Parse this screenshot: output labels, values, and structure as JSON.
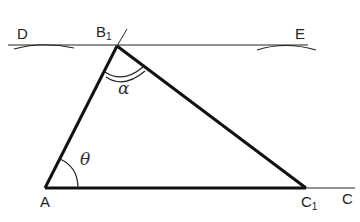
{
  "diagram": {
    "type": "geometric construction - triangle",
    "points": {
      "D": {
        "label": "D",
        "x": 18,
        "y": 26
      },
      "B1": {
        "label": "B",
        "sub": "1",
        "x": 96,
        "y": 24
      },
      "E": {
        "label": "E",
        "x": 295,
        "y": 26
      },
      "A": {
        "label": "A",
        "x": 40,
        "y": 194
      },
      "C1": {
        "label": "C",
        "sub": "1",
        "x": 302,
        "y": 194
      },
      "C": {
        "label": "C",
        "x": 342,
        "y": 192
      }
    },
    "angles": {
      "alpha": {
        "label": "α",
        "at": "B1"
      },
      "theta": {
        "label": "θ",
        "at": "A"
      }
    },
    "segments": [
      "AB1",
      "B1C1",
      "AC1",
      "C1C",
      "DE"
    ],
    "stroke_color": "#111111"
  }
}
